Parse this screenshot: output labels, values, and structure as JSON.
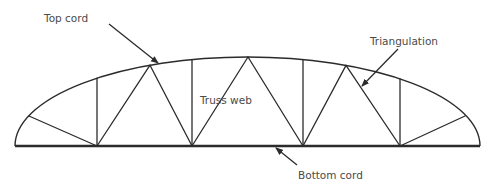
{
  "diagram": {
    "colors": {
      "line": "#2b2b2b",
      "label": "#4a4a4a",
      "background": "#ffffff"
    },
    "labels": {
      "top_cord": "Top cord",
      "triangulation": "Triangulation",
      "truss_web": "Truss web",
      "bottom_cord": "Bottom cord"
    },
    "geometry": {
      "span_left_x": 15,
      "span_right_x": 480,
      "bottom_y": 146,
      "crown_y": 57,
      "bottom_joints_x": [
        97,
        192,
        303,
        400
      ],
      "apex_joints_x": [
        150,
        248,
        346
      ],
      "end_diagonals": [
        {
          "from_x": 97,
          "to": [
            29,
            116
          ]
        },
        {
          "from_x": 400,
          "to": [
            465,
            116
          ]
        }
      ]
    },
    "callouts": [
      {
        "label_key": "top_cord",
        "text_pos": [
          44,
          22
        ],
        "from": [
          109,
          24
        ],
        "to": [
          158,
          63
        ]
      },
      {
        "label_key": "triangulation",
        "text_pos": [
          370,
          45
        ],
        "from": [
          398,
          49
        ],
        "to": [
          362,
          86
        ]
      },
      {
        "label_key": "truss_web",
        "text_pos": [
          200,
          104
        ]
      },
      {
        "label_key": "bottom_cord",
        "text_pos": [
          298,
          179
        ],
        "from": [
          297,
          165
        ],
        "to": [
          276,
          148
        ]
      }
    ]
  }
}
